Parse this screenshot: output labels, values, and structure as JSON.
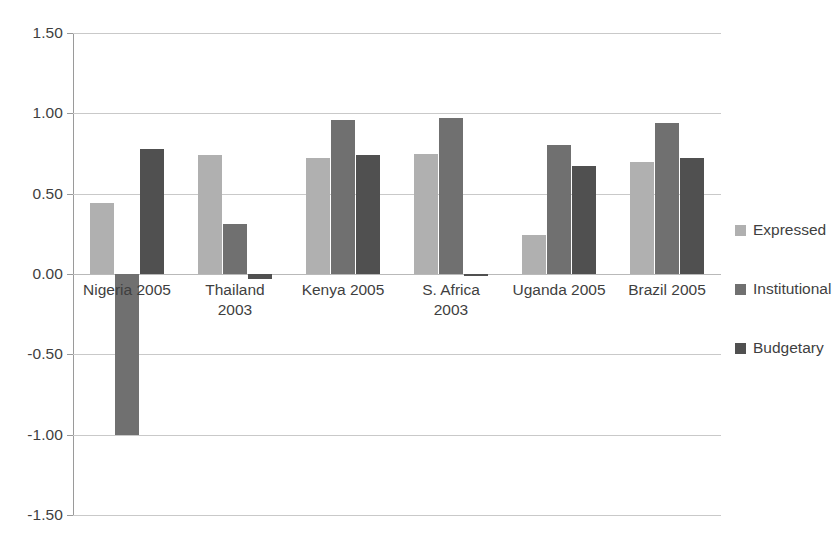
{
  "chart_data": {
    "type": "bar",
    "title": "",
    "subtitle": "",
    "xlabel": "",
    "ylabel": "",
    "ylim": [
      -1.5,
      1.5
    ],
    "ytick_values": [
      1.5,
      1.0,
      0.5,
      0.0,
      -0.5,
      -1.0,
      -1.5
    ],
    "ytick_labels": [
      "1.50",
      "1.00",
      "0.50",
      "0.00",
      "-0.50",
      "-1.00",
      "-1.50"
    ],
    "grid": "horizontal",
    "legend_position": "right",
    "categories": [
      "Nigeria 2005",
      "Thailand\n2003",
      "Kenya 2005",
      "S. Africa\n2003",
      "Uganda 2005",
      "Brazil 2005"
    ],
    "series": [
      {
        "name": "Expressed",
        "color": "#b0b0b0",
        "values": [
          0.44,
          0.74,
          0.72,
          0.75,
          0.24,
          0.7
        ]
      },
      {
        "name": "Institutional",
        "color": "#707070",
        "values": [
          -1.0,
          0.31,
          0.96,
          0.97,
          0.8,
          0.94
        ]
      },
      {
        "name": "Budgetary",
        "color": "#505050",
        "values": [
          0.78,
          -0.03,
          0.74,
          -0.01,
          0.67,
          0.72
        ]
      }
    ]
  },
  "legend": {
    "items": [
      {
        "label": "Expressed",
        "color": "#b0b0b0"
      },
      {
        "label": "Institutional",
        "color": "#707070"
      },
      {
        "label": "Budgetary",
        "color": "#505050"
      }
    ]
  },
  "axis": {
    "y_labels": [
      "1.50",
      "1.00",
      "0.50",
      "0.00",
      "-0.50",
      "-1.00",
      "-1.50"
    ],
    "x_labels": [
      "Nigeria 2005",
      "Thailand\n2003",
      "Kenya 2005",
      "S. Africa\n2003",
      "Uganda 2005",
      "Brazil 2005"
    ]
  }
}
